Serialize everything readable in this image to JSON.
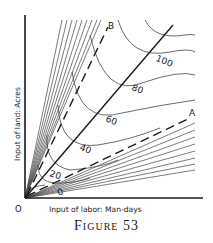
{
  "figure": {
    "caption": "Figure 53",
    "origin_label": "O",
    "x_axis_label": "Input of labor: Man-days",
    "y_axis_label": "Input of land: Acres",
    "ridge_lines": [
      {
        "label": "A",
        "style": "dashed"
      },
      {
        "label": "B",
        "style": "dashed"
      }
    ],
    "expansion_path": {
      "style": "solid"
    },
    "isoquant_labels": [
      "0",
      "20",
      "40",
      "60",
      "80",
      "100"
    ],
    "colors": {
      "ink": "#1a1a1a",
      "thin_line": "#444444",
      "background": "#ffffff"
    }
  }
}
